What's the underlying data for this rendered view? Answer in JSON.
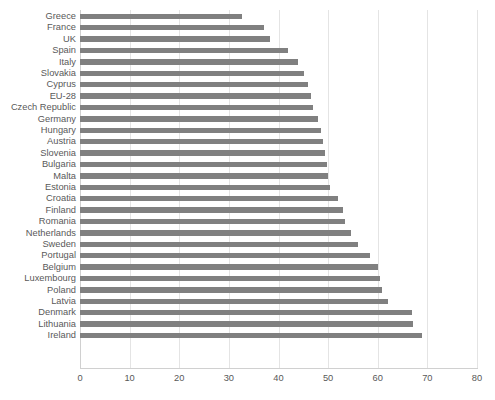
{
  "chart_data": {
    "type": "bar",
    "orientation": "horizontal",
    "title": "",
    "xlabel": "",
    "ylabel": "",
    "xlim": [
      0,
      80
    ],
    "xticks": [
      "0",
      "10",
      "20",
      "30",
      "40",
      "50",
      "60",
      "70",
      "80"
    ],
    "xtick_values": [
      0,
      10,
      20,
      30,
      40,
      50,
      60,
      70,
      80
    ],
    "grid": true,
    "grid_axis": "x",
    "legend": false,
    "legend_position": "none",
    "bar_color": "#808080",
    "gridline_color": "#e4e4e4",
    "text_color": "#595959",
    "categories": [
      "Greece",
      "France",
      "UK",
      "Spain",
      "Italy",
      "Slovakia",
      "Cyprus",
      "EU-28",
      "Czech Republic",
      "Germany",
      "Hungary",
      "Austria",
      "Slovenia",
      "Bulgaria",
      "Malta",
      "Estonia",
      "Croatia",
      "Finland",
      "Romania",
      "Netherlands",
      "Sweden",
      "Portugal",
      "Belgium",
      "Luxembourg",
      "Poland",
      "Latvia",
      "Denmark",
      "Lithuania",
      "Ireland"
    ],
    "values": [
      32.6,
      37.0,
      38.2,
      42.0,
      44.0,
      45.2,
      46.0,
      46.5,
      47.0,
      48.0,
      48.6,
      49.0,
      49.4,
      49.8,
      50.0,
      50.4,
      52.0,
      53.0,
      53.4,
      54.6,
      56.0,
      58.4,
      60.0,
      60.4,
      60.8,
      62.0,
      67.0,
      67.2,
      69.0
    ]
  },
  "caption": {
    "text": ""
  }
}
